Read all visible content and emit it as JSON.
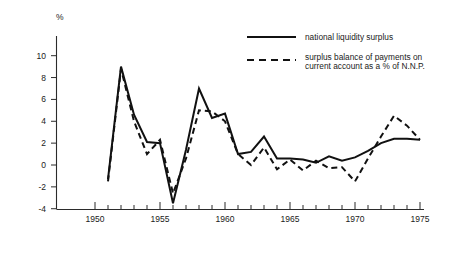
{
  "chart_data": {
    "type": "line",
    "title": "",
    "xlabel": "",
    "ylabel": "%",
    "unit_label": "%",
    "xlim": [
      1950,
      1975
    ],
    "ylim": [
      -4,
      10
    ],
    "grid": false,
    "legend_position": "top-right",
    "y_ticks": [
      -4,
      -2,
      0,
      2,
      4,
      6,
      8,
      10
    ],
    "y_tick_labels": [
      "-4",
      "-2",
      "0",
      "2",
      "4",
      "6",
      "8",
      "10"
    ],
    "x_ticks": [
      1950,
      1955,
      1960,
      1965,
      1970,
      1975
    ],
    "x_tick_labels": [
      "1950",
      "1955",
      "1960",
      "1965",
      "1970",
      "1975"
    ],
    "x_minor_ticks": [
      1951,
      1952,
      1953,
      1954,
      1956,
      1957,
      1958,
      1959,
      1961,
      1962,
      1963,
      1964,
      1966,
      1967,
      1968,
      1969,
      1971,
      1972,
      1973,
      1974
    ],
    "series": [
      {
        "name": "national liquidity surplus",
        "style": "solid",
        "x": [
          1951,
          1952,
          1953,
          1954,
          1955,
          1956,
          1957,
          1958,
          1959,
          1960,
          1961,
          1962,
          1963,
          1964,
          1965,
          1966,
          1967,
          1968,
          1969,
          1970,
          1971,
          1972,
          1973,
          1974,
          1975
        ],
        "values": [
          -1.3,
          9.0,
          4.6,
          2.1,
          2.0,
          -3.5,
          1.4,
          7.0,
          4.3,
          4.7,
          1.0,
          1.2,
          2.6,
          0.6,
          0.6,
          0.5,
          0.2,
          0.8,
          0.4,
          0.7,
          1.3,
          2.0,
          2.4,
          2.4,
          2.3
        ]
      },
      {
        "name": "surplus balance of payments on current account as a % of N.N.P.",
        "style": "dashed",
        "x": [
          1951,
          1952,
          1953,
          1954,
          1955,
          1956,
          1957,
          1958,
          1959,
          1960,
          1961,
          1962,
          1963,
          1964,
          1965,
          1966,
          1967,
          1968,
          1969,
          1970,
          1971,
          1972,
          1973,
          1974,
          1975
        ],
        "values": [
          -1.5,
          8.8,
          4.0,
          1.0,
          2.3,
          -2.6,
          0.6,
          5.0,
          4.9,
          4.0,
          1.0,
          0.0,
          1.6,
          -0.4,
          0.5,
          -0.5,
          0.4,
          -0.3,
          -0.2,
          -1.5,
          0.6,
          2.6,
          4.5,
          3.6,
          2.3
        ]
      }
    ]
  },
  "legend": {
    "items": [
      {
        "label": "national liquidity surplus",
        "style": "solid"
      },
      {
        "label": "surplus balance of payments on",
        "label2": "current account as a % of N.N.P.",
        "style": "dashed"
      }
    ]
  }
}
